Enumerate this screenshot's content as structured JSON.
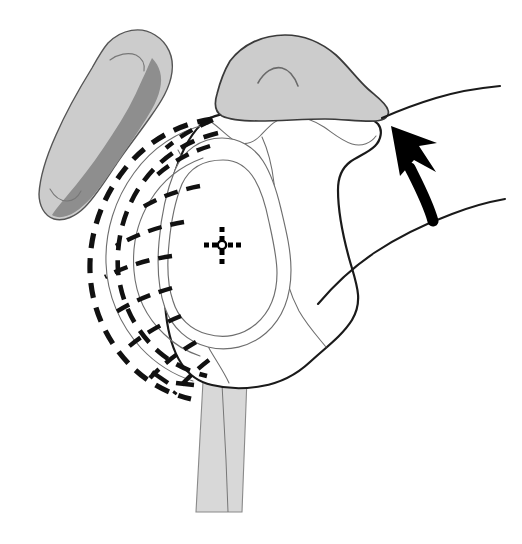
{
  "figure": {
    "title": "Shoulder joint — scapula, glenoid and coracoid with rotational displacement arc",
    "domain": "anatomical-line-drawing",
    "canvas": {
      "width": 522,
      "height": 544,
      "background": "#ffffff"
    },
    "palette": {
      "outline_dark": "#1a1a1a",
      "outline_thin": "#5a5a5a",
      "fill_light_gray": "#cccccc",
      "fill_mid_gray": "#8e8e8e",
      "fill_pale_gray": "#d8d8d8",
      "arrow_black": "#000000",
      "background": "#ffffff"
    },
    "parts": [
      {
        "id": "coracoid-process",
        "label": "Coracoid process",
        "fill": "#cccccc",
        "shadow_fill": "#8e8e8e",
        "position": "upper-left",
        "outline": "#4a4a4a"
      },
      {
        "id": "acromion",
        "label": "Acromion",
        "fill": "#cccccc",
        "position": "upper-center",
        "outline": "#3a3a3a"
      },
      {
        "id": "glenoid-fossa",
        "label": "Glenoid fossa",
        "fill": "#ffffff",
        "position": "center",
        "outline": "#6a6a6a",
        "contours": 2
      },
      {
        "id": "scapular-body",
        "label": "Scapular body",
        "fill": "#ffffff",
        "position": "center-right",
        "outline": "#1a1a1a"
      },
      {
        "id": "scapular-spine-column",
        "label": "Scapular spine / inferior column",
        "fill": "#d8d8d8",
        "position": "bottom-center",
        "outline": "#8a8a8a"
      },
      {
        "id": "clavicle-line-superior",
        "label": "Superior clavicle line",
        "position": "right-upper",
        "outline": "#1a1a1a"
      },
      {
        "id": "rib-line-inferior",
        "label": "Inferior thoracic line",
        "position": "right-lower",
        "outline": "#1a1a1a"
      }
    ],
    "annotations": {
      "center_marker": {
        "id": "glenoid-center-crosshair",
        "label": "Glenoid center point",
        "type": "dotted-crosshair",
        "x": 222,
        "y": 245,
        "arm_dots": 3,
        "dot_size": 4,
        "color": "#000000"
      },
      "motion_arrow": {
        "id": "rotation-arrow",
        "label": "Direction of displacement",
        "type": "curved-arrow",
        "direction": "up-left",
        "tip_x": 392,
        "tip_y": 128,
        "tail_x": 432,
        "tail_y": 220,
        "color": "#000000"
      },
      "displacement_arc": {
        "id": "rotational-displacement-fan",
        "label": "Rotational displacement fan",
        "style": "dashed",
        "color": "#111111",
        "outer_arcs": 1,
        "inner_arcs": 2,
        "radial_spokes": 9,
        "dash_pattern": "14 9",
        "stroke_width": 5
      }
    }
  }
}
